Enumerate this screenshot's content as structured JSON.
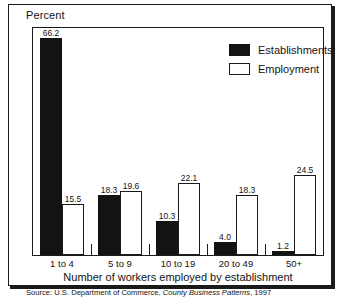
{
  "chart_data": {
    "type": "bar",
    "title": "",
    "xlabel": "Number of workers employed by establishment",
    "ylabel": "Percent",
    "ylim": [
      0,
      70
    ],
    "grid": false,
    "legend_position": "top-right-inside",
    "categories": [
      "1 to 4",
      "5 to 9",
      "10 to 19",
      "20 to 49",
      "50+"
    ],
    "series": [
      {
        "name": "Establishments",
        "color": "#131313",
        "style": "filled",
        "values": [
          66.2,
          18.3,
          10.3,
          4.0,
          1.2
        ],
        "labels": [
          "66.2",
          "18.3",
          "10.3",
          "4.0",
          "1.2"
        ]
      },
      {
        "name": "Employment",
        "color": "#ffffff",
        "style": "outlined",
        "values": [
          15.5,
          19.6,
          22.1,
          18.3,
          24.5
        ],
        "labels": [
          "15.5",
          "19.6",
          "22.1",
          "18.3",
          "24.5"
        ]
      }
    ],
    "source_note": {
      "prefix": "Source: U.S. Department of Commerce, ",
      "italic": "County Business Patterns",
      "suffix": ", 1997"
    }
  },
  "colors": {
    "frame": "#1a1a1a",
    "text": "#131313",
    "establishments": "#131313",
    "employment": "#ffffff"
  }
}
